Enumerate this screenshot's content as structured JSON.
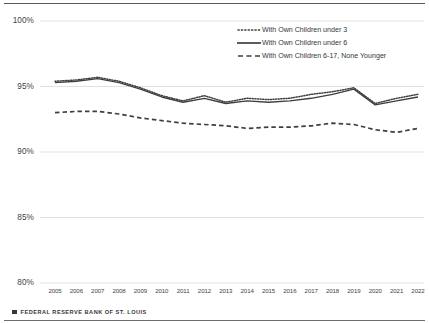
{
  "footer": {
    "logo_icon": "square-logo-icon",
    "text": "FEDERAL RESERVE BANK OF ST. LOUIS"
  },
  "colors": {
    "line": "#3f3f3f",
    "grid": "#d9d9d9",
    "text": "#3f3f3f",
    "rule": "#555a5e"
  },
  "chart_data": {
    "type": "line",
    "title": "",
    "xlabel": "",
    "ylabel": "",
    "ylim": [
      80,
      100
    ],
    "yticks": [
      "80%",
      "85%",
      "90%",
      "95%",
      "100%"
    ],
    "ytick_values": [
      80,
      85,
      90,
      95,
      100
    ],
    "grid": true,
    "legend_position": "top-right",
    "categories": [
      2005,
      2006,
      2007,
      2008,
      2009,
      2010,
      2011,
      2012,
      2013,
      2014,
      2015,
      2016,
      2017,
      2018,
      2019,
      2020,
      2021,
      2022
    ],
    "xtick_labels": [
      "2005",
      "2006",
      "2007",
      "2008",
      "2009",
      "2010",
      "2011",
      "2012",
      "2013",
      "2014",
      "2015",
      "2016",
      "2017",
      "2018",
      "2019",
      "2020",
      "2021",
      "2022"
    ],
    "series": [
      {
        "name": "With Own Children under 3",
        "style": "dotted",
        "values": [
          95.4,
          95.5,
          95.7,
          95.4,
          94.9,
          94.3,
          93.9,
          94.3,
          93.8,
          94.1,
          94.0,
          94.1,
          94.4,
          94.6,
          94.9,
          93.7,
          94.1,
          94.4
        ]
      },
      {
        "name": "With Own Children under 6",
        "style": "solid",
        "values": [
          95.3,
          95.4,
          95.6,
          95.3,
          94.8,
          94.2,
          93.8,
          94.1,
          93.7,
          93.9,
          93.8,
          93.9,
          94.1,
          94.4,
          94.8,
          93.6,
          93.9,
          94.2
        ]
      },
      {
        "name": "With Own Children 6-17, None Younger",
        "style": "dashed",
        "values": [
          93.0,
          93.1,
          93.1,
          92.9,
          92.6,
          92.4,
          92.2,
          92.1,
          92.0,
          91.8,
          91.9,
          91.9,
          92.0,
          92.2,
          92.1,
          91.7,
          91.5,
          91.8
        ]
      }
    ]
  }
}
